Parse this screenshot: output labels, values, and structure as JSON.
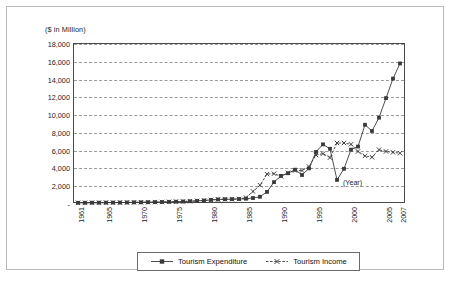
{
  "chart_data": {
    "type": "line",
    "title": "",
    "subtitle": "",
    "xlabel": "(Year)",
    "ylabel": "($ in Million)",
    "ylim": [
      0,
      18000
    ],
    "xlim": [
      1961,
      2007
    ],
    "grid": true,
    "legend_position": "bottom",
    "y_ticks": [
      "-",
      "2,000",
      "4,000",
      "6,000",
      "8,000",
      "10,000",
      "12,000",
      "14,000",
      "16,000",
      "18,000"
    ],
    "y_tick_values": [
      0,
      2000,
      4000,
      6000,
      8000,
      10000,
      12000,
      14000,
      16000,
      18000
    ],
    "x_ticks": [
      "1961",
      "1965",
      "1970",
      "1975",
      "1980",
      "1985",
      "1990",
      "1995",
      "2000",
      "2005",
      "2007"
    ],
    "x_tick_values": [
      1961,
      1965,
      1970,
      1975,
      1980,
      1985,
      1990,
      1995,
      2000,
      2005,
      2007
    ],
    "x": [
      1961,
      1962,
      1963,
      1964,
      1965,
      1966,
      1967,
      1968,
      1969,
      1970,
      1971,
      1972,
      1973,
      1974,
      1975,
      1976,
      1977,
      1978,
      1979,
      1980,
      1981,
      1982,
      1983,
      1984,
      1985,
      1986,
      1987,
      1988,
      1989,
      1990,
      1991,
      1992,
      1993,
      1994,
      1995,
      1996,
      1997,
      1998,
      1999,
      2000,
      2001,
      2002,
      2003,
      2004,
      2005,
      2006,
      2007
    ],
    "series": [
      {
        "name": "Tourism Expenditure",
        "marker": "square",
        "line_style": "solid",
        "color": "#3a3a3a",
        "values": [
          20,
          25,
          30,
          35,
          40,
          45,
          50,
          60,
          70,
          80,
          90,
          100,
          110,
          130,
          150,
          170,
          200,
          240,
          280,
          350,
          400,
          420,
          430,
          450,
          480,
          560,
          700,
          1250,
          2350,
          3050,
          3350,
          3750,
          3150,
          3900,
          5750,
          6600,
          6100,
          2600,
          3850,
          6000,
          6350,
          8800,
          8100,
          9600,
          11800,
          14000,
          15700
        ]
      },
      {
        "name": "Tourism Income",
        "marker": "x",
        "line_style": "dashed",
        "color": "#3a3a3a",
        "values": [
          20,
          25,
          30,
          35,
          40,
          45,
          50,
          60,
          70,
          80,
          90,
          100,
          110,
          130,
          150,
          170,
          200,
          240,
          280,
          350,
          400,
          420,
          430,
          450,
          600,
          1300,
          2000,
          3250,
          3300,
          3000,
          3400,
          3650,
          3650,
          4100,
          5400,
          5550,
          5100,
          6750,
          6750,
          6600,
          5800,
          5300,
          5150,
          6000,
          5800,
          5700,
          5600
        ]
      }
    ]
  },
  "legend": {
    "items": [
      {
        "label": "Tourism Expenditure"
      },
      {
        "label": "Tourism Income"
      }
    ]
  }
}
